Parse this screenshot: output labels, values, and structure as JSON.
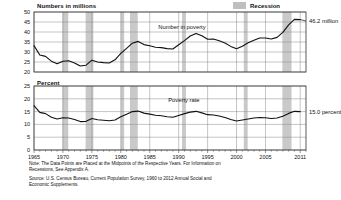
{
  "legend": {
    "label": "Recession",
    "swatch_color": "#bfbfbf"
  },
  "panels": {
    "top": {
      "axis_title": "Numbers in millions",
      "series_label": "Number in poverty",
      "end_value_label": "46.2 million"
    },
    "bottom": {
      "axis_title": "Percent",
      "series_label": "Poverty rate",
      "end_value_label": "15.0 percent"
    }
  },
  "footnotes": {
    "note": "Note: The Data Points are Placed at the Midpoints of the Respective Years. For Information on\nRecessions, See Appendix A.",
    "source": "Source: U.S. Census Bureau, Current Population Survey, 1960 to 2012 Annual Social and\nEconomic Supplements."
  },
  "chart_data": [
    {
      "type": "line",
      "id": "number-in-poverty",
      "title": "Numbers in millions",
      "xlabel": "",
      "ylabel": "Numbers in millions",
      "xlim": [
        1965,
        2012
      ],
      "ylim": [
        20,
        50
      ],
      "yticks": [
        20,
        25,
        30,
        35,
        40,
        45,
        50
      ],
      "xticks": [
        1965,
        1970,
        1975,
        1980,
        1985,
        1990,
        1995,
        2000,
        2005,
        2011
      ],
      "grid": true,
      "legend_position": "top-right",
      "annotations": [
        {
          "text": "Number in poverty",
          "x": 1992,
          "y": 42
        },
        {
          "text": "46.2 million",
          "x": 2012,
          "y": 45.5
        }
      ],
      "x": [
        1965,
        1966,
        1967,
        1968,
        1969,
        1970,
        1971,
        1972,
        1973,
        1974,
        1975,
        1976,
        1977,
        1978,
        1979,
        1980,
        1981,
        1982,
        1983,
        1984,
        1985,
        1986,
        1987,
        1988,
        1989,
        1990,
        1991,
        1992,
        1993,
        1994,
        1995,
        1996,
        1997,
        1998,
        1999,
        2000,
        2001,
        2002,
        2003,
        2004,
        2005,
        2006,
        2007,
        2008,
        2009,
        2010,
        2011
      ],
      "values": [
        33.2,
        28.5,
        27.8,
        25.4,
        24.1,
        25.4,
        25.6,
        24.5,
        23.0,
        23.4,
        25.9,
        25.0,
        24.7,
        24.5,
        26.1,
        29.3,
        31.8,
        34.4,
        35.3,
        33.7,
        33.1,
        32.4,
        32.2,
        31.7,
        31.5,
        33.6,
        35.7,
        38.0,
        39.3,
        38.1,
        36.4,
        36.5,
        35.6,
        34.5,
        32.8,
        31.6,
        32.9,
        34.6,
        35.9,
        37.0,
        37.0,
        36.5,
        37.3,
        39.8,
        43.6,
        46.3,
        46.2
      ]
    },
    {
      "type": "line",
      "id": "poverty-rate",
      "title": "Percent",
      "xlabel": "",
      "ylabel": "Percent",
      "xlim": [
        1965,
        2012
      ],
      "ylim": [
        0,
        25
      ],
      "yticks": [
        0,
        5,
        10,
        15,
        20,
        25
      ],
      "xticks": [
        1965,
        1970,
        1975,
        1980,
        1985,
        1990,
        1995,
        2000,
        2005,
        2011
      ],
      "grid": true,
      "annotations": [
        {
          "text": "Poverty rate",
          "x": 1992,
          "y": 19
        },
        {
          "text": "15.0 percent",
          "x": 2012,
          "y": 15.0
        }
      ],
      "x": [
        1965,
        1966,
        1967,
        1968,
        1969,
        1970,
        1971,
        1972,
        1973,
        1974,
        1975,
        1976,
        1977,
        1978,
        1979,
        1980,
        1981,
        1982,
        1983,
        1984,
        1985,
        1986,
        1987,
        1988,
        1989,
        1990,
        1991,
        1992,
        1993,
        1994,
        1995,
        1996,
        1997,
        1998,
        1999,
        2000,
        2001,
        2002,
        2003,
        2004,
        2005,
        2006,
        2007,
        2008,
        2009,
        2010,
        2011
      ],
      "values": [
        17.3,
        14.7,
        14.2,
        12.8,
        12.1,
        12.6,
        12.5,
        11.9,
        11.1,
        11.2,
        12.3,
        11.8,
        11.6,
        11.4,
        11.7,
        13.0,
        14.0,
        15.0,
        15.2,
        14.4,
        14.0,
        13.6,
        13.4,
        13.0,
        12.8,
        13.5,
        14.2,
        14.8,
        15.1,
        14.5,
        13.8,
        13.7,
        13.3,
        12.7,
        11.9,
        11.3,
        11.7,
        12.1,
        12.5,
        12.7,
        12.6,
        12.3,
        12.5,
        13.2,
        14.3,
        15.1,
        15.0
      ]
    }
  ],
  "recessions": [
    {
      "start": 1969.92,
      "end": 1970.92
    },
    {
      "start": 1973.92,
      "end": 1975.25
    },
    {
      "start": 1980.0,
      "end": 1980.58
    },
    {
      "start": 1981.58,
      "end": 1982.92
    },
    {
      "start": 1990.58,
      "end": 1991.25
    },
    {
      "start": 2001.25,
      "end": 2001.92
    },
    {
      "start": 2007.92,
      "end": 2009.5
    }
  ]
}
